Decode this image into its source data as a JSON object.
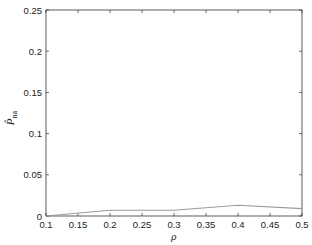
{
  "chart_data": {
    "type": "line",
    "title": "",
    "xlabel": "ρ",
    "ylabel": "P̂_na",
    "ylabel_main": "P̂",
    "ylabel_sub": "na",
    "xlim": [
      0.1,
      0.5
    ],
    "ylim": [
      0,
      0.25
    ],
    "x_ticks": [
      "0.1",
      "0.15",
      "0.2",
      "0.25",
      "0.3",
      "0.35",
      "0.4",
      "0.45",
      "0.5"
    ],
    "y_ticks": [
      "0",
      "0.05",
      "0.1",
      "0.15",
      "0.2",
      "0.25"
    ],
    "grid": false,
    "legend": null,
    "series": [
      {
        "name": "P̂_na",
        "color": "#9a9a9a",
        "x": [
          0.1,
          0.2,
          0.3,
          0.4,
          0.5
        ],
        "y": [
          0.0,
          0.007,
          0.007,
          0.013,
          0.009
        ]
      }
    ]
  }
}
